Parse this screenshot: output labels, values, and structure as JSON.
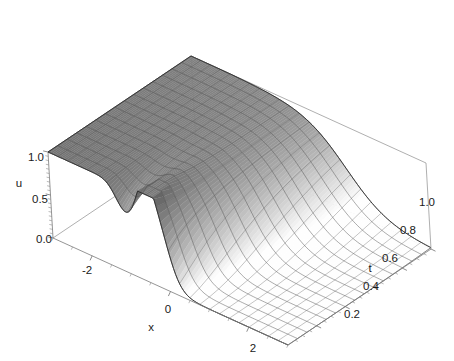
{
  "figure": {
    "kind": "3d-surface-plot",
    "background_color": "#ffffff",
    "width": 454,
    "height": 361
  },
  "axes": {
    "x": {
      "label": "x",
      "ticks": [
        "-2",
        "0",
        "2"
      ],
      "tick_values": [
        -2,
        0,
        2
      ],
      "range": [
        -3,
        3
      ]
    },
    "t": {
      "label": "t",
      "ticks": [
        "0.2",
        "0.4",
        "0.6",
        "0.8",
        "1.0"
      ],
      "tick_values": [
        0.2,
        0.4,
        0.6,
        0.8,
        1.0
      ],
      "range": [
        0,
        1
      ]
    },
    "u": {
      "label": "u",
      "ticks": [
        "0.0",
        "0.5",
        "1.0"
      ],
      "tick_values": [
        0.0,
        0.5,
        1.0
      ],
      "range": [
        0,
        1
      ]
    }
  },
  "style": {
    "surface_dark": "#6f6f6f",
    "surface_light": "#fdfdfd",
    "mesh_color": "#4a4a4a",
    "box_color": "#8c8c8c",
    "text_color": "#1a1a1a"
  },
  "chart_data": {
    "type": "surface",
    "title": "",
    "xlabel": "x",
    "ylabel": "t",
    "zlabel": "u",
    "xlim": [
      -3,
      3
    ],
    "ylim": [
      0,
      1
    ],
    "zlim": [
      0,
      1
    ],
    "grid": false,
    "legend": false,
    "x": [
      -3,
      -2.75,
      -2.5,
      -2.25,
      -2,
      -1.75,
      -1.5,
      -1.25,
      -1,
      -0.75,
      -0.5,
      -0.25,
      0,
      0.25,
      0.5,
      0.75,
      1,
      1.25,
      1.5,
      1.75,
      2,
      2.25,
      2.5,
      2.75,
      3
    ],
    "t": [
      0,
      0.0667,
      0.1333,
      0.2,
      0.2667,
      0.3333,
      0.4,
      0.4667,
      0.5333,
      0.6,
      0.6667,
      0.7333,
      0.8,
      0.8667,
      0.9333,
      1
    ],
    "series": [
      {
        "name": "t=0",
        "values": [
          1.0,
          1.0,
          1.0,
          1.0,
          0.99,
          0.98,
          0.95,
          0.88,
          0.74,
          0.72,
          0.88,
          0.62,
          0.18,
          0.03,
          0.0,
          0.0,
          0.0,
          0.0,
          0.0,
          0.0,
          0.0,
          0.0,
          0.0,
          0.0,
          0.0
        ]
      },
      {
        "name": "t=0.0667",
        "values": [
          1.0,
          1.0,
          1.0,
          1.0,
          0.99,
          0.98,
          0.95,
          0.89,
          0.79,
          0.74,
          0.76,
          0.62,
          0.3,
          0.08,
          0.01,
          0.0,
          0.0,
          0.0,
          0.0,
          0.0,
          0.0,
          0.0,
          0.0,
          0.0,
          0.0
        ]
      },
      {
        "name": "t=0.1333",
        "values": [
          1.0,
          1.0,
          1.0,
          1.0,
          0.99,
          0.98,
          0.96,
          0.91,
          0.83,
          0.77,
          0.73,
          0.62,
          0.38,
          0.14,
          0.03,
          0.0,
          0.0,
          0.0,
          0.0,
          0.0,
          0.0,
          0.0,
          0.0,
          0.0,
          0.0
        ]
      },
      {
        "name": "t=0.2",
        "values": [
          1.0,
          1.0,
          1.0,
          1.0,
          0.99,
          0.98,
          0.96,
          0.92,
          0.86,
          0.79,
          0.72,
          0.62,
          0.43,
          0.2,
          0.06,
          0.01,
          0.0,
          0.0,
          0.0,
          0.0,
          0.0,
          0.0,
          0.0,
          0.0,
          0.0
        ]
      },
      {
        "name": "t=0.2667",
        "values": [
          1.0,
          1.0,
          1.0,
          1.0,
          0.99,
          0.98,
          0.96,
          0.93,
          0.88,
          0.81,
          0.73,
          0.62,
          0.47,
          0.26,
          0.1,
          0.02,
          0.0,
          0.0,
          0.0,
          0.0,
          0.0,
          0.0,
          0.0,
          0.0,
          0.0
        ]
      },
      {
        "name": "t=0.3333",
        "values": [
          1.0,
          1.0,
          1.0,
          1.0,
          0.99,
          0.98,
          0.96,
          0.93,
          0.89,
          0.83,
          0.75,
          0.63,
          0.49,
          0.31,
          0.14,
          0.04,
          0.01,
          0.0,
          0.0,
          0.0,
          0.0,
          0.0,
          0.0,
          0.0,
          0.0
        ]
      },
      {
        "name": "t=0.4",
        "values": [
          1.0,
          1.0,
          1.0,
          1.0,
          0.99,
          0.98,
          0.96,
          0.94,
          0.9,
          0.84,
          0.77,
          0.65,
          0.51,
          0.35,
          0.19,
          0.07,
          0.02,
          0.0,
          0.0,
          0.0,
          0.0,
          0.0,
          0.0,
          0.0,
          0.0
        ]
      },
      {
        "name": "t=0.4667",
        "values": [
          1.0,
          1.0,
          1.0,
          1.0,
          0.99,
          0.98,
          0.96,
          0.94,
          0.9,
          0.85,
          0.79,
          0.67,
          0.53,
          0.38,
          0.23,
          0.1,
          0.03,
          0.01,
          0.0,
          0.0,
          0.0,
          0.0,
          0.0,
          0.0,
          0.0
        ]
      },
      {
        "name": "t=0.5333",
        "values": [
          1.0,
          1.0,
          1.0,
          1.0,
          0.99,
          0.98,
          0.96,
          0.94,
          0.91,
          0.86,
          0.8,
          0.69,
          0.55,
          0.41,
          0.27,
          0.13,
          0.05,
          0.01,
          0.0,
          0.0,
          0.0,
          0.0,
          0.0,
          0.0,
          0.0
        ]
      },
      {
        "name": "t=0.6",
        "values": [
          1.0,
          1.0,
          1.0,
          1.0,
          0.99,
          0.98,
          0.96,
          0.94,
          0.91,
          0.87,
          0.81,
          0.71,
          0.57,
          0.44,
          0.3,
          0.17,
          0.07,
          0.02,
          0.0,
          0.0,
          0.0,
          0.0,
          0.0,
          0.0,
          0.0
        ]
      },
      {
        "name": "t=0.6667",
        "values": [
          1.0,
          1.0,
          1.0,
          1.0,
          0.99,
          0.98,
          0.96,
          0.94,
          0.91,
          0.87,
          0.82,
          0.73,
          0.59,
          0.46,
          0.33,
          0.2,
          0.09,
          0.03,
          0.01,
          0.0,
          0.0,
          0.0,
          0.0,
          0.0,
          0.0
        ]
      },
      {
        "name": "t=0.7333",
        "values": [
          1.0,
          1.0,
          1.0,
          1.0,
          0.99,
          0.98,
          0.96,
          0.94,
          0.92,
          0.88,
          0.83,
          0.74,
          0.61,
          0.48,
          0.36,
          0.23,
          0.12,
          0.04,
          0.01,
          0.0,
          0.0,
          0.0,
          0.0,
          0.0,
          0.0
        ]
      },
      {
        "name": "t=0.8",
        "values": [
          1.0,
          1.0,
          1.0,
          1.0,
          0.99,
          0.98,
          0.96,
          0.94,
          0.92,
          0.88,
          0.84,
          0.75,
          0.63,
          0.5,
          0.38,
          0.26,
          0.14,
          0.06,
          0.02,
          0.0,
          0.0,
          0.0,
          0.0,
          0.0,
          0.0
        ]
      },
      {
        "name": "t=0.8667",
        "values": [
          1.0,
          1.0,
          1.0,
          1.0,
          0.99,
          0.98,
          0.96,
          0.94,
          0.92,
          0.89,
          0.84,
          0.76,
          0.65,
          0.52,
          0.4,
          0.28,
          0.17,
          0.08,
          0.02,
          0.01,
          0.0,
          0.0,
          0.0,
          0.0,
          0.0
        ]
      },
      {
        "name": "t=0.9333",
        "values": [
          1.0,
          1.0,
          1.0,
          1.0,
          0.99,
          0.98,
          0.96,
          0.94,
          0.92,
          0.89,
          0.85,
          0.77,
          0.66,
          0.54,
          0.42,
          0.3,
          0.19,
          0.1,
          0.03,
          0.01,
          0.0,
          0.0,
          0.0,
          0.0,
          0.0
        ]
      },
      {
        "name": "t=1",
        "values": [
          1.0,
          1.0,
          1.0,
          1.0,
          0.99,
          0.98,
          0.96,
          0.94,
          0.92,
          0.89,
          0.85,
          0.78,
          0.67,
          0.56,
          0.44,
          0.32,
          0.21,
          0.11,
          0.04,
          0.01,
          0.0,
          0.0,
          0.0,
          0.0,
          0.0
        ]
      }
    ]
  }
}
